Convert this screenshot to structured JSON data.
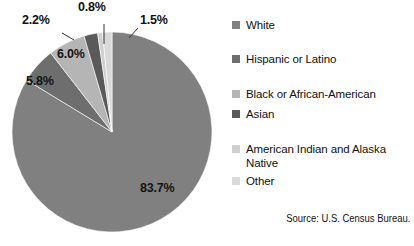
{
  "chart_data": {
    "type": "pie",
    "title": "",
    "source": "Source: U.S. Census Bureau.",
    "legend_position": "right",
    "grid": false,
    "units": "percent",
    "categories": [
      "White",
      "Hispanic or Latino",
      "Black or African-American",
      "Asian",
      "American Indian and Alaska Native",
      "Other"
    ],
    "values": [
      83.7,
      5.8,
      6.0,
      2.2,
      0.8,
      1.5
    ],
    "labels": [
      "83.7%",
      "5.8%",
      "6.0%",
      "2.2%",
      "0.8%",
      "1.5%"
    ],
    "colors": [
      "#808080",
      "#6e6e6e",
      "#b5b5b5",
      "#5a5a5a",
      "#cfcfcf",
      "#d9d9d9"
    ],
    "slices": [
      {
        "name": "White",
        "value": 83.7,
        "label": "83.7%",
        "color": "#808080"
      },
      {
        "name": "Hispanic or Latino",
        "value": 5.8,
        "label": "5.8%",
        "color": "#6e6e6e"
      },
      {
        "name": "Black or African-American",
        "value": 6.0,
        "label": "6.0%",
        "color": "#b5b5b5"
      },
      {
        "name": "Asian",
        "value": 2.2,
        "label": "2.2%",
        "color": "#5a5a5a"
      },
      {
        "name": "American Indian and Alaska Native",
        "value": 0.8,
        "label": "0.8%",
        "color": "#cfcfcf"
      },
      {
        "name": "Other",
        "value": 1.5,
        "label": "1.5%",
        "color": "#d9d9d9"
      }
    ]
  },
  "legend": {
    "items": [
      {
        "label": "White",
        "color": "#808080"
      },
      {
        "label": "Hispanic or Latino",
        "color": "#6e6e6e"
      },
      {
        "label": "Black or African-American",
        "color": "#b5b5b5"
      },
      {
        "label": "Asian",
        "color": "#5a5a5a"
      },
      {
        "label": "American Indian and Alaska Native",
        "color": "#cfcfcf"
      },
      {
        "label": "Other",
        "color": "#d9d9d9"
      }
    ]
  },
  "callouts": {
    "white": "83.7%",
    "hispanic": "5.8%",
    "black": "6.0%",
    "asian": "2.2%",
    "american_indian": "0.8%",
    "other": "1.5%"
  },
  "source_note": "Source: U.S. Census Bureau."
}
